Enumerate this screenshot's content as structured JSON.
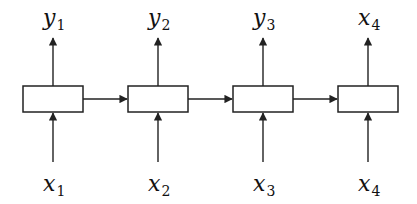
{
  "diagram": {
    "type": "rnn-unrolled",
    "cells": [
      {
        "id": "cell-1",
        "input": {
          "var": "x",
          "sub": "1"
        },
        "output": {
          "var": "y",
          "sub": "1"
        }
      },
      {
        "id": "cell-2",
        "input": {
          "var": "x",
          "sub": "2"
        },
        "output": {
          "var": "y",
          "sub": "2"
        }
      },
      {
        "id": "cell-3",
        "input": {
          "var": "x",
          "sub": "3"
        },
        "output": {
          "var": "y",
          "sub": "3"
        }
      },
      {
        "id": "cell-4",
        "input": {
          "var": "x",
          "sub": "4"
        },
        "output": {
          "var": "x",
          "sub": "4"
        }
      }
    ],
    "edges": [
      {
        "from": "cell-1",
        "to": "cell-2"
      },
      {
        "from": "cell-2",
        "to": "cell-3"
      },
      {
        "from": "cell-3",
        "to": "cell-4"
      }
    ],
    "colors": {
      "stroke": "#222222",
      "background": "#ffffff",
      "text": "#111111"
    }
  }
}
